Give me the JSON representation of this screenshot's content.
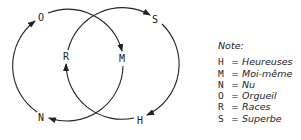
{
  "diagram": {
    "nodes": [
      {
        "id": "O",
        "label": "O"
      },
      {
        "id": "S",
        "label": "S"
      },
      {
        "id": "R",
        "label": "R"
      },
      {
        "id": "M",
        "label": "M"
      },
      {
        "id": "N",
        "label": "N"
      },
      {
        "id": "H",
        "label": "H"
      }
    ],
    "edges": [
      {
        "from": "N",
        "to": "O",
        "circle": "left"
      },
      {
        "from": "O",
        "to": "M",
        "circle": "left"
      },
      {
        "from": "M",
        "to": "N",
        "circle": "left"
      },
      {
        "from": "R",
        "to": "S",
        "circle": "right"
      },
      {
        "from": "S",
        "to": "H",
        "circle": "right"
      },
      {
        "from": "H",
        "to": "R",
        "circle": "right"
      }
    ]
  },
  "note": {
    "title": "Note:",
    "entries": [
      {
        "key": "H",
        "eq": "=",
        "value": "Heureuses"
      },
      {
        "key": "M",
        "eq": "=",
        "value": "Moi-même"
      },
      {
        "key": "N",
        "eq": "=",
        "value": "Nu"
      },
      {
        "key": "O",
        "eq": "=",
        "value": "Orgueil"
      },
      {
        "key": "R",
        "eq": "=",
        "value": "Races"
      },
      {
        "key": "S",
        "eq": "=",
        "value": "Superbe"
      }
    ]
  }
}
